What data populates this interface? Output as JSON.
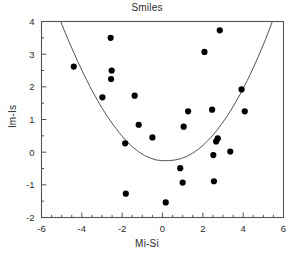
{
  "chart_data": {
    "type": "scatter",
    "title": "Smiles",
    "xlabel": "Mi-Si",
    "ylabel": "Im-Is",
    "xlim": [
      -6,
      6
    ],
    "ylim": [
      -2,
      4
    ],
    "xticks": [
      -6,
      -4,
      -2,
      0,
      2,
      4,
      6
    ],
    "xtick_labels": [
      "-6",
      "-4",
      "-2",
      "0",
      "2",
      "4",
      "6"
    ],
    "yticks": [
      -2,
      -1,
      0,
      1,
      2,
      3,
      4
    ],
    "ytick_labels": [
      "-2",
      "-1",
      "0",
      "1",
      "2",
      "3",
      "4"
    ],
    "x_minor_tick_step": 0.5,
    "y_minor_tick_step": 0.5,
    "grid": false,
    "legend": null,
    "marker": "filled-circle",
    "marker_color": "#000000",
    "marker_size": 3.1,
    "frame_color": "#555555",
    "curve_color": "#555555",
    "points": [
      [
        -4.4,
        2.62
      ],
      [
        -2.98,
        1.68
      ],
      [
        -2.57,
        3.5
      ],
      [
        -2.52,
        2.5
      ],
      [
        -2.55,
        2.24
      ],
      [
        -1.85,
        0.27
      ],
      [
        -1.82,
        -1.27
      ],
      [
        -1.38,
        1.73
      ],
      [
        -1.18,
        0.84
      ],
      [
        -0.5,
        0.45
      ],
      [
        0.16,
        -1.54
      ],
      [
        0.88,
        -0.49
      ],
      [
        1.0,
        -0.93
      ],
      [
        1.05,
        0.78
      ],
      [
        1.27,
        1.25
      ],
      [
        2.08,
        3.07
      ],
      [
        2.46,
        1.3
      ],
      [
        2.52,
        -0.09
      ],
      [
        2.55,
        -0.89
      ],
      [
        2.66,
        0.33
      ],
      [
        2.74,
        0.42
      ],
      [
        2.84,
        3.73
      ],
      [
        3.36,
        0.02
      ],
      [
        3.92,
        1.92
      ],
      [
        4.08,
        1.25
      ]
    ],
    "curve": {
      "type": "parabola",
      "equation_label": null,
      "vertex": [
        0.62,
        0.19
      ],
      "coefficient_a": 0.1075,
      "samples": [
        [
          -5.05,
          4.0
        ],
        [
          -4.8,
          3.62
        ],
        [
          -4.5,
          3.19
        ],
        [
          -4.2,
          2.77
        ],
        [
          -3.9,
          2.38
        ],
        [
          -3.6,
          2.01
        ],
        [
          -3.3,
          1.67
        ],
        [
          -3.0,
          1.35
        ],
        [
          -2.7,
          1.06
        ],
        [
          -2.4,
          0.8
        ],
        [
          -2.1,
          0.56
        ],
        [
          -1.8,
          0.35
        ],
        [
          -1.5,
          0.17
        ],
        [
          -1.2,
          0.02
        ],
        [
          -0.9,
          -0.1
        ],
        [
          -0.6,
          -0.18
        ],
        [
          -0.3,
          -0.24
        ],
        [
          0.0,
          -0.26
        ],
        [
          0.3,
          -0.26
        ],
        [
          0.62,
          -0.24
        ],
        [
          0.9,
          -0.2
        ],
        [
          1.2,
          -0.13
        ],
        [
          1.5,
          -0.03
        ],
        [
          1.8,
          0.1
        ],
        [
          2.1,
          0.26
        ],
        [
          2.4,
          0.45
        ],
        [
          2.7,
          0.67
        ],
        [
          3.0,
          0.92
        ],
        [
          3.3,
          1.19
        ],
        [
          3.6,
          1.5
        ],
        [
          3.9,
          1.83
        ],
        [
          4.2,
          2.19
        ],
        [
          4.5,
          2.58
        ],
        [
          4.8,
          3.0
        ],
        [
          5.1,
          3.44
        ],
        [
          5.4,
          3.92
        ],
        [
          5.6,
          4.25
        ],
        [
          6.0,
          4.99
        ]
      ]
    }
  }
}
